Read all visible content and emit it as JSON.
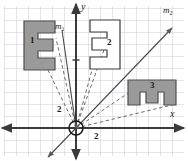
{
  "figure": {
    "width": 188,
    "height": 161,
    "background": "#ffffff",
    "grid": {
      "cell_size": 12,
      "color": "#c8c8d2",
      "visible": true,
      "origin_x": 76,
      "origin_y": 128
    },
    "axes": {
      "color": "#3a3a3a",
      "x_label": "x",
      "y_label": "y",
      "x_label_pos": [
        171,
        110
      ],
      "y_label_pos": [
        81,
        3
      ]
    },
    "origin_marker": {
      "name": "origin-circle",
      "cx": 76,
      "cy": 128,
      "r": 7,
      "color": "#1a1a1a"
    },
    "lines": [
      {
        "id": "m1",
        "label": "m",
        "subscript": "1",
        "label_pos": [
          55,
          24
        ],
        "color": "#3a3a3a"
      },
      {
        "id": "m2",
        "label": "m",
        "subscript": "2",
        "label_pos": [
          164,
          8
        ],
        "color": "#3a3a3a"
      }
    ],
    "shapes": [
      {
        "id": "shape1",
        "label": "1",
        "label_pos": [
          31,
          40
        ],
        "fill": "#9a9a9a",
        "stroke": "#4a4a4a",
        "orientation": "E facing right, shaded",
        "points": "24,21 55,21 55,33 38,33 38,39 53,39 53,51 38,51 38,58 55,58 55,70 24,70"
      },
      {
        "id": "shape2",
        "label": "2",
        "label_pos": [
          108,
          42
        ],
        "fill": "#ffffff",
        "stroke": "#3a3a3a",
        "orientation": "E mirrored facing left, unshaded",
        "points": "120,20 90,20 90,32 107,32 107,38 92,38 92,50 107,50 107,57 90,57 90,69 120,69"
      },
      {
        "id": "shape3",
        "label": "3",
        "label_pos": [
          152,
          85
        ],
        "fill": "#9a9a9a",
        "stroke": "#4a4a4a",
        "orientation": "E rotated, opening downward, shaded",
        "points": "128,80 176,80 176,105 164,105 164,92 158,92 158,103 146,103 146,92 140,92 140,105 128,105"
      }
    ],
    "dashed_rays": {
      "color": "#6a6a6a",
      "note": "rays from origin to each figure"
    },
    "distance_labels": [
      {
        "text": "2",
        "pos": [
          58,
          107
        ],
        "name": "distance-label-vertical"
      },
      {
        "text": "2",
        "pos": [
          94,
          133
        ],
        "name": "distance-label-horizontal"
      }
    ]
  }
}
